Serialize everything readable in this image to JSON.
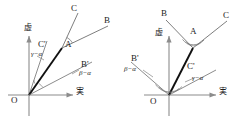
{
  "figure": {
    "type": "vector-diagram-pair"
  },
  "axes": {
    "imaginary_label": "虚",
    "real_label": "実",
    "origin_label": "O"
  },
  "left": {
    "name": "left-diagram",
    "points": {
      "A": "A",
      "B": "B",
      "C": "C",
      "B_prime": "B'",
      "C_prime": "C'"
    },
    "angles": {
      "beta_minus_alpha": "β−α",
      "gamma_minus_alpha": "γ−α"
    }
  },
  "right": {
    "name": "right-diagram",
    "points": {
      "A": "A",
      "B": "B",
      "C": "C",
      "B_prime": "B'",
      "C_prime": "C'"
    },
    "angles": {
      "beta_minus_alpha": "β−α",
      "gamma_minus_alpha": "γ−α"
    }
  },
  "colors": {
    "axis": "#8c8c8c",
    "thin_ray": "#6f6f6f",
    "thick_ray": "#111111",
    "text": "#1b1b1b"
  }
}
